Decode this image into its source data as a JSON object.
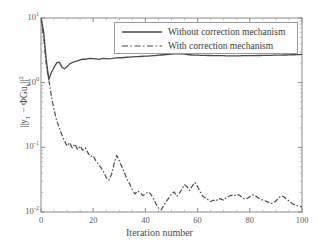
{
  "chart_data": {
    "type": "line",
    "title": "",
    "xlabel": "Iteration number",
    "ylabel": "||y_T - ΦGu_k||^2",
    "yscale": "log",
    "xlim": [
      0,
      100
    ],
    "ylim": [
      0.01,
      10
    ],
    "grid": false,
    "legend_position": "upper-right",
    "xticks": [
      "0",
      "20",
      "40",
      "60",
      "80",
      "100"
    ],
    "xtick_values": [
      0,
      20,
      40,
      60,
      80,
      100
    ],
    "yticks": [
      "10^-2",
      "10^-1",
      "10^0",
      "10^1"
    ],
    "ytick_values": [
      0.01,
      0.1,
      1,
      10
    ],
    "series": [
      {
        "name": "Without correction mechanism",
        "style": "solid",
        "color": "#4a4a4a",
        "x": [
          0,
          1,
          2,
          3,
          4,
          5,
          6,
          7,
          8,
          9,
          10,
          11,
          12,
          13,
          14,
          15,
          16,
          17,
          18,
          19,
          20,
          21,
          22,
          23,
          24,
          25,
          26,
          27,
          28,
          29,
          30,
          31,
          32,
          33,
          34,
          35,
          36,
          37,
          38,
          39,
          40,
          41,
          42,
          43,
          44,
          45,
          46,
          47,
          48,
          49,
          50,
          51,
          52,
          53,
          54,
          55,
          56,
          57,
          58,
          59,
          60,
          61,
          62,
          63,
          64,
          65,
          66,
          67,
          68,
          69,
          70,
          71,
          72,
          73,
          74,
          75,
          76,
          77,
          78,
          79,
          80,
          81,
          82,
          83,
          84,
          85,
          86,
          87,
          88,
          89,
          90,
          91,
          92,
          93,
          94,
          95,
          96,
          97,
          98,
          99,
          100
        ],
        "values": [
          10.0,
          6.2,
          2.3,
          1.12,
          1.45,
          1.72,
          2.02,
          2.08,
          1.74,
          1.64,
          1.78,
          1.95,
          2.05,
          2.12,
          2.18,
          2.26,
          2.32,
          2.3,
          2.35,
          2.38,
          2.36,
          2.33,
          2.3,
          2.34,
          2.38,
          2.36,
          2.33,
          2.36,
          2.4,
          2.42,
          2.44,
          2.43,
          2.45,
          2.47,
          2.48,
          2.5,
          2.52,
          2.52,
          2.54,
          2.56,
          2.57,
          2.58,
          2.6,
          2.62,
          2.63,
          2.66,
          2.68,
          2.7,
          2.72,
          2.74,
          2.76,
          2.78,
          2.8,
          2.82,
          2.8,
          2.76,
          2.72,
          2.7,
          2.68,
          2.67,
          2.66,
          2.65,
          2.64,
          2.64,
          2.63,
          2.63,
          2.62,
          2.62,
          2.61,
          2.61,
          2.61,
          2.6,
          2.6,
          2.6,
          2.6,
          2.6,
          2.6,
          2.61,
          2.61,
          2.61,
          2.62,
          2.62,
          2.62,
          2.63,
          2.63,
          2.64,
          2.64,
          2.65,
          2.65,
          2.66,
          2.66,
          2.67,
          2.67,
          2.68,
          2.68,
          2.69,
          2.7,
          2.7,
          2.71,
          2.72,
          2.74
        ]
      },
      {
        "name": "With correction mechanism",
        "style": "dash-dot",
        "color": "#4a4a4a",
        "x": [
          0,
          1,
          2,
          3,
          4,
          5,
          6,
          7,
          8,
          9,
          10,
          11,
          12,
          13,
          14,
          15,
          16,
          17,
          18,
          19,
          20,
          21,
          22,
          23,
          24,
          25,
          26,
          27,
          28,
          29,
          30,
          31,
          32,
          33,
          34,
          35,
          36,
          37,
          38,
          39,
          40,
          41,
          42,
          43,
          44,
          45,
          46,
          47,
          48,
          49,
          50,
          51,
          52,
          53,
          54,
          55,
          56,
          57,
          58,
          59,
          60,
          61,
          62,
          63,
          64,
          65,
          66,
          67,
          68,
          69,
          70,
          71,
          72,
          73,
          74,
          75,
          76,
          77,
          78,
          79,
          80,
          81,
          82,
          83,
          84,
          85,
          86,
          87,
          88,
          89,
          90,
          91,
          92,
          93,
          94,
          95,
          96,
          97,
          98,
          99,
          100
        ],
        "values": [
          10.0,
          5.0,
          1.9,
          1.1,
          0.62,
          0.38,
          0.26,
          0.2,
          0.155,
          0.125,
          0.105,
          0.118,
          0.098,
          0.112,
          0.092,
          0.104,
          0.09,
          0.098,
          0.082,
          0.072,
          0.074,
          0.062,
          0.055,
          0.048,
          0.042,
          0.034,
          0.031,
          0.038,
          0.055,
          0.075,
          0.062,
          0.05,
          0.04,
          0.032,
          0.027,
          0.022,
          0.019,
          0.021,
          0.02,
          0.018,
          0.019,
          0.0205,
          0.019,
          0.0165,
          0.0135,
          0.0115,
          0.0108,
          0.0125,
          0.0145,
          0.0165,
          0.019,
          0.0205,
          0.0175,
          0.0195,
          0.0225,
          0.0265,
          0.0245,
          0.0215,
          0.0255,
          0.0285,
          0.0245,
          0.0205,
          0.0175,
          0.0165,
          0.0155,
          0.0145,
          0.0152,
          0.0148,
          0.0162,
          0.0158,
          0.0152,
          0.0168,
          0.0175,
          0.0182,
          0.0178,
          0.0188,
          0.0182,
          0.017,
          0.0158,
          0.0162,
          0.0172,
          0.0185,
          0.018,
          0.0168,
          0.0158,
          0.0152,
          0.0148,
          0.0142,
          0.0135,
          0.0138,
          0.0148,
          0.0165,
          0.0178,
          0.0172,
          0.016,
          0.0148,
          0.0138,
          0.013,
          0.0126,
          0.0122,
          0.012
        ]
      }
    ]
  },
  "legend": {
    "entries": [
      {
        "label": "Without correction mechanism",
        "style": "solid"
      },
      {
        "label": "With correction mechanism",
        "style": "dash-dot"
      }
    ]
  },
  "axes": {
    "xlabel": "Iteration number",
    "xtick_labels": [
      "0",
      "20",
      "40",
      "60",
      "80",
      "100"
    ],
    "ytick_bases": [
      "10",
      "10",
      "10",
      "10"
    ],
    "ytick_exponents": [
      "1",
      "0",
      "-1",
      "-2"
    ],
    "ylabel_parts": {
      "norm_open": "||y",
      "sub_T": "T",
      "minus": " − ΦGu",
      "sub_k": "k",
      "norm_close": "||",
      "sup_2": "2"
    }
  }
}
